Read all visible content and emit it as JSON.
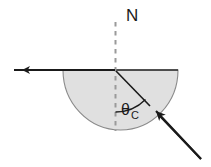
{
  "figure": {
    "width": 211,
    "height": 167,
    "background_color": "#ffffff"
  },
  "labels": {
    "normal": "N",
    "critical_angle_symbol": "θ",
    "critical_angle_subscript": "C"
  },
  "colors": {
    "stroke": "#1a1a1a",
    "medium_fill": "#e0e0e0",
    "medium_outline": "#7a7a7a",
    "dashed_normal": "#9a9a9a",
    "arc": "#1a1a1a"
  },
  "geometry": {
    "interface_y": 70,
    "center_x": 115,
    "semicircle_left_x": 63,
    "semicircle_right_x": 178,
    "semicircle_bottom_y": 130,
    "normal_top_y": 22,
    "normal_bottom_y": 130,
    "reflected_ray_start_x": 115,
    "reflected_ray_end_x": 14,
    "incident_ray_start_x": 201,
    "incident_ray_start_y": 159,
    "incident_ray_end_x": 117,
    "incident_ray_end_y": 72,
    "arc_radius": 40,
    "arc_angle_degrees": 45
  },
  "elements": {
    "medium_name": "semicircular-dense-medium",
    "incident_ray_name": "incident-ray",
    "reflected_ray_name": "reflected-ray",
    "normal_line_name": "normal-dashed-line",
    "angle_arc_name": "critical-angle-arc"
  }
}
